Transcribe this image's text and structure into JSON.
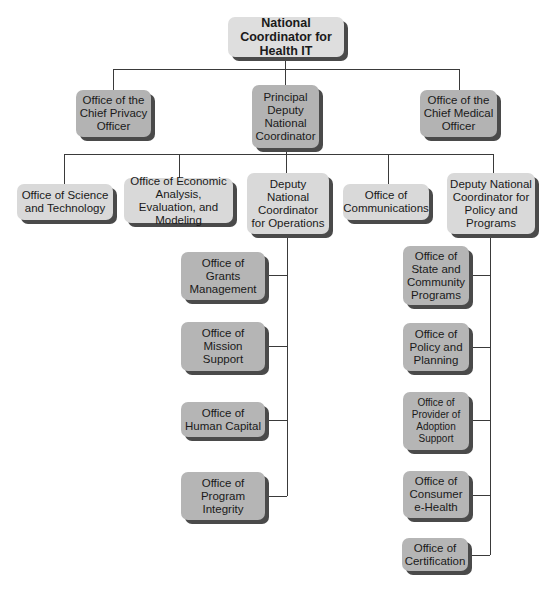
{
  "chart_title": "",
  "nodes": {
    "root": {
      "label": "National Coordinator for Health IT"
    },
    "chief_privacy": {
      "label": "Office of the Chief Privacy Officer"
    },
    "principal_deputy": {
      "label": "Principal Deputy National Coordinator"
    },
    "chief_medical": {
      "label": "Office of the Chief Medical Officer"
    },
    "science_tech": {
      "label": "Office of Science and Technology"
    },
    "economic": {
      "label": "Office of Economic Analysis, Evaluation, and Modeling"
    },
    "deputy_ops": {
      "label": "Deputy National Coordinator for Operations"
    },
    "communications": {
      "label": "Office of Communications"
    },
    "deputy_policy": {
      "label": "Deputy National Coordinator for Policy and Programs"
    },
    "grants": {
      "label": "Office of Grants Management"
    },
    "mission": {
      "label": "Office of Mission Support"
    },
    "human_capital": {
      "label": "Office of Human Capital"
    },
    "program_integrity": {
      "label": "Office of Program Integrity"
    },
    "state_community": {
      "label": "Office of State and Community Programs"
    },
    "policy_planning": {
      "label": "Office of Policy and Planning"
    },
    "provider_adoption": {
      "label": "Office of Provider of Adoption Support"
    },
    "consumer_ehealth": {
      "label": "Office of Consumer e-Health"
    },
    "certification": {
      "label": "Office of Certification"
    }
  },
  "hierarchy": {
    "root": [
      "chief_privacy",
      "principal_deputy",
      "chief_medical"
    ],
    "principal_deputy": [
      "science_tech",
      "economic",
      "deputy_ops",
      "communications",
      "deputy_policy"
    ],
    "deputy_ops": [
      "grants",
      "mission",
      "human_capital",
      "program_integrity"
    ],
    "deputy_policy": [
      "state_community",
      "policy_planning",
      "provider_adoption",
      "consumer_ehealth",
      "certification"
    ]
  },
  "colors": {
    "root_fill": "#dedede",
    "level1_fill": "#b3b3b3",
    "level2_fill": "#d9d9d9",
    "level3_fill": "#b5b5b5",
    "shadow": "#4a4a4a",
    "connector": "#3a3a3a"
  }
}
